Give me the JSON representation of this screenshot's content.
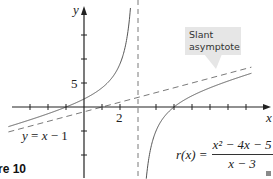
{
  "chart_data": {
    "type": "line",
    "title": "",
    "caption": "re 10",
    "xlabel": "x",
    "ylabel": "y",
    "x_tick_labels": [
      {
        "value": 2,
        "label": "2"
      }
    ],
    "y_tick_labels": [
      {
        "value": 5,
        "label": "5"
      }
    ],
    "x_ticks": [
      -3,
      -2,
      -1,
      1,
      2,
      4,
      5,
      6,
      7,
      8,
      9
    ],
    "y_ticks": [
      -10,
      -5,
      5,
      10,
      15
    ],
    "xlim": [
      -4.5,
      10.3
    ],
    "ylim": [
      -14.8,
      20
    ],
    "grid": false,
    "series": [
      {
        "name": "r(x) = (x^2 - 4x - 5)/(x - 3)",
        "style": "solid",
        "function": "(x*x - 4*x - 5)/(x - 3)",
        "points_sample": [
          [
            -4,
            -3.86
          ],
          [
            -1,
            0
          ],
          [
            0,
            1.67
          ],
          [
            1,
            4
          ],
          [
            2,
            9
          ],
          [
            2.5,
            17.5
          ],
          [
            3.5,
            -11.5
          ],
          [
            4,
            -5
          ],
          [
            5,
            0
          ],
          [
            6,
            2.33
          ],
          [
            8,
            5.4
          ],
          [
            10,
            7.86
          ]
        ]
      },
      {
        "name": "Slant asymptote y = x - 1",
        "style": "dashed",
        "function": "x - 1",
        "points_sample": [
          [
            -4,
            -5
          ],
          [
            10,
            9
          ]
        ]
      },
      {
        "name": "Vertical asymptote x = 3",
        "style": "dashed",
        "x": 3
      }
    ],
    "annotations": [
      {
        "text": "Slant asymptote",
        "type": "callout"
      },
      {
        "text": "y = x − 1",
        "near": "slant asymptote, left"
      },
      {
        "text": "r(x) = (x² − 4x − 5)/(x − 3)",
        "near": "right branch"
      }
    ]
  },
  "labels": {
    "y_axis": "y",
    "x_axis": "x",
    "y_tick_5": "5",
    "x_tick_2": "2",
    "asymptote_eq_y": "y",
    "asymptote_eq_rest": " = ",
    "asymptote_eq_x": "x",
    "asymptote_eq_tail": " − 1",
    "callout_line1": "Slant",
    "callout_line2": "asymptote",
    "caption": "re 10",
    "formula_lhs": "r(x) =",
    "formula_num": "x² − 4x − 5",
    "formula_den": "x − 3"
  },
  "colors": {
    "axis": "#222222",
    "curve": "#555555",
    "dashed": "#7a7a7a",
    "callout_bg": "#e6e6e6"
  }
}
